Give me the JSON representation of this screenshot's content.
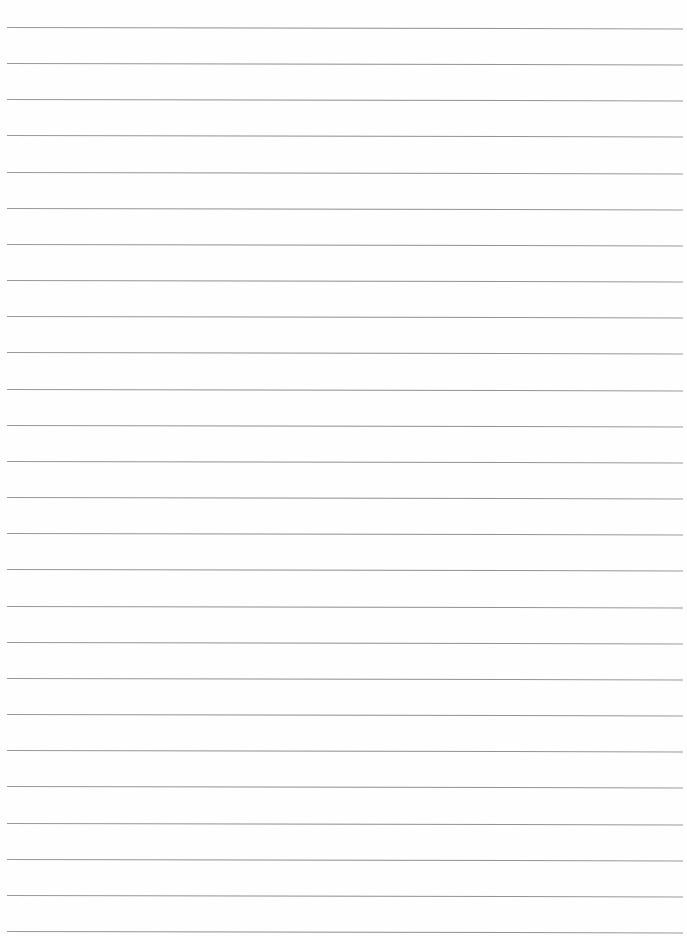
{
  "page": {
    "type": "ruled-notebook-paper",
    "line_count": 26,
    "line_color": "#8c8c8c",
    "background_color": "#fefefe",
    "text": ""
  }
}
